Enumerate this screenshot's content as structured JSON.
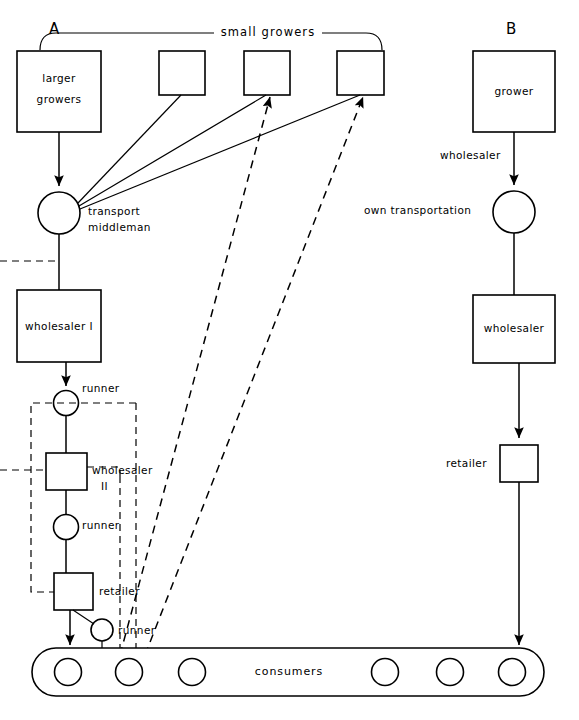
{
  "diagram": {
    "panels": [
      {
        "id": "A",
        "label": "A"
      },
      {
        "id": "B",
        "label": "B"
      }
    ],
    "headers": [
      {
        "name": "small-growers",
        "label": "small growers"
      }
    ],
    "panel_a": {
      "nodes": [
        {
          "name": "larger-growers",
          "shape": "rect",
          "label": "larger\ngrowers",
          "label_line1": "larger",
          "label_line2": "growers"
        },
        {
          "name": "small-grower-1",
          "shape": "rect",
          "label": ""
        },
        {
          "name": "small-grower-2",
          "shape": "rect",
          "label": ""
        },
        {
          "name": "small-grower-3",
          "shape": "rect",
          "label": ""
        },
        {
          "name": "transport-middleman",
          "shape": "circle",
          "label_line1": "transport",
          "label_line2": "middleman"
        },
        {
          "name": "wholesaler-i",
          "shape": "rect",
          "label": "wholesaler I"
        },
        {
          "name": "runner-1",
          "shape": "circle",
          "label": "runner"
        },
        {
          "name": "wholesaler-ii",
          "shape": "rect",
          "label_line1": "wholesaler",
          "label_line2": "II"
        },
        {
          "name": "runner-2",
          "shape": "circle",
          "label": "runner"
        },
        {
          "name": "retailer",
          "shape": "rect",
          "label": "retailer"
        },
        {
          "name": "runner-3",
          "shape": "circle",
          "label": "runner"
        }
      ]
    },
    "panel_b": {
      "nodes": [
        {
          "name": "grower",
          "shape": "rect",
          "label": "grower"
        },
        {
          "name": "own-transportation",
          "shape": "circle",
          "label": "own  transportation"
        },
        {
          "name": "wholesaler",
          "shape": "rect",
          "label": "wholesaler"
        },
        {
          "name": "retailer",
          "shape": "rect",
          "label": "retailer"
        }
      ],
      "edge_labels": [
        {
          "name": "wholesaler-edge-label",
          "label": "wholesaler"
        }
      ]
    },
    "consumers": {
      "name": "consumers-bar",
      "label": "consumers",
      "count": 6
    }
  },
  "labels": {
    "panel_a_letter": "A",
    "panel_b_letter": "B",
    "small_growers": "small growers",
    "larger_growers_l1": "larger",
    "larger_growers_l2": "growers",
    "transport_l1": "transport",
    "transport_l2": "middleman",
    "wholesaler_i": "wholesaler I",
    "runner_1": "runner",
    "wholesaler_ii_l1": "wholesaler",
    "wholesaler_ii_l2": "II",
    "runner_2": "runner",
    "retailer_a": "retailer",
    "runner_3": "runner",
    "grower_b": "grower",
    "wholesaler_edge_b": "wholesaler",
    "own_transportation": "own  transportation",
    "wholesaler_b": "wholesaler",
    "retailer_b": "retailer",
    "consumers": "consumers"
  },
  "colors": {
    "stroke": "#000000",
    "fill": "#ffffff",
    "background": "#ffffff"
  }
}
